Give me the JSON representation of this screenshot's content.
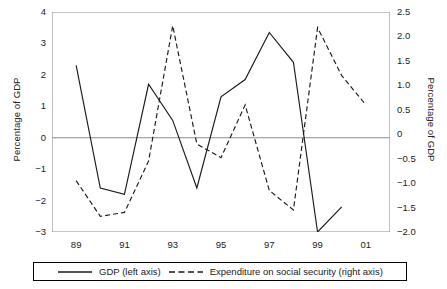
{
  "chart_data": {
    "type": "line",
    "title": "",
    "xlabel": "",
    "ylabel": "Percentage of GDP",
    "ylabel_right": "Percentage of GDP",
    "grid": false,
    "legend_position": "bottom",
    "x": [
      89,
      90,
      91,
      92,
      93,
      94,
      95,
      96,
      97,
      98,
      99,
      100,
      101
    ],
    "x_tick_labels": [
      "89",
      "91",
      "93",
      "95",
      "97",
      "99",
      "01"
    ],
    "x_tick_values": [
      89,
      91,
      93,
      95,
      97,
      99,
      101
    ],
    "x_minor_ticks": [
      90,
      92,
      94,
      96,
      98,
      100
    ],
    "xlim": [
      88,
      102
    ],
    "ylim": [
      -3,
      4
    ],
    "y_tick_labels": [
      "4",
      "3",
      "2",
      "1",
      "0",
      "-1",
      "-2",
      "-3"
    ],
    "y_tick_values": [
      4,
      3,
      2,
      1,
      0,
      -1,
      -2,
      -3
    ],
    "ylim_right": [
      -2.0,
      2.5
    ],
    "y_tick_labels_right": [
      "2.5",
      "2.0",
      "1.5",
      "1.0",
      "0.5",
      "0",
      "-0.5",
      "-1.0",
      "-1.5",
      "-2.0"
    ],
    "y_tick_values_right": [
      2.5,
      2.0,
      1.5,
      1.0,
      0.5,
      0,
      -0.5,
      -1.0,
      -1.5,
      -2.0
    ],
    "series": [
      {
        "name": "GDP (left axis)",
        "axis": "left",
        "style": "solid",
        "color": "#1a1a1a",
        "x": [
          89,
          90,
          91,
          92,
          93,
          94,
          95,
          96,
          97,
          98,
          99,
          100
        ],
        "values": [
          2.3,
          -1.6,
          -1.8,
          1.7,
          0.55,
          -1.6,
          1.3,
          1.85,
          3.35,
          2.4,
          -3.0,
          -2.2
        ]
      },
      {
        "name": "Expenditure on social security (right axis)",
        "axis": "right",
        "style": "dashed",
        "color": "#1a1a1a",
        "x": [
          89,
          90,
          91,
          92,
          93,
          94,
          95,
          96,
          97,
          98,
          99,
          100,
          101
        ],
        "values": [
          -0.95,
          -1.68,
          -1.6,
          -0.55,
          2.22,
          -0.2,
          -0.48,
          0.6,
          -1.15,
          -1.55,
          2.18,
          1.2,
          0.6
        ]
      }
    ]
  },
  "axes": {
    "left_title": "Percentage of GDP",
    "right_title": "Percentage of GDP"
  },
  "legend": {
    "items": [
      {
        "label": "GDP (left axis)",
        "style": "solid"
      },
      {
        "label": "Expenditure on social security (right axis)",
        "style": "dashed"
      }
    ]
  }
}
